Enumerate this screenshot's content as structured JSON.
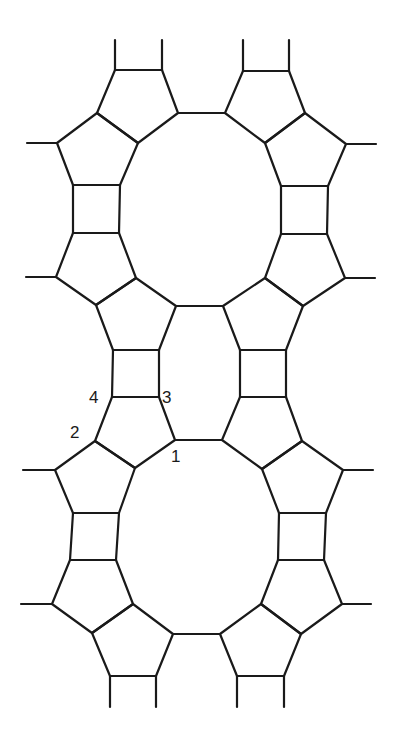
{
  "diagram": {
    "type": "framework-structure",
    "line_color": "#1a1a1a",
    "background": "#ffffff",
    "labels": [
      {
        "text": "4",
        "x": 97,
        "y": 403
      },
      {
        "text": "3",
        "x": 163,
        "y": 403
      },
      {
        "text": "2",
        "x": 72,
        "y": 436
      },
      {
        "text": "1",
        "x": 172,
        "y": 465
      }
    ],
    "rings": {
      "pentagons": 12,
      "squares": 6,
      "large_rings": 2,
      "middle_ring": 1
    }
  }
}
